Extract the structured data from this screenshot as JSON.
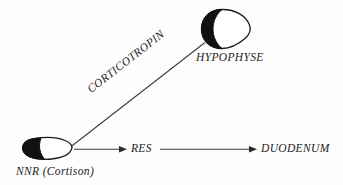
{
  "diagram": {
    "background_color": "#fdfdfd",
    "ink_color": "#1b1b1b",
    "fill_black": "#111111",
    "fill_white": "#ffffff",
    "nodes": [
      {
        "id": "hypophyse",
        "label": "HYPOPHYSE",
        "shape": "pituitary-gland-glyph",
        "style": "half-black-half-white"
      },
      {
        "id": "nnr",
        "label": "NNR (Cortison)",
        "shape": "adrenal-gland-glyph",
        "style": "half-black-half-white"
      },
      {
        "id": "res",
        "label": "RES",
        "shape": "text-node"
      },
      {
        "id": "duodenum",
        "label": "DUODENUM",
        "shape": "text-node"
      }
    ],
    "edges": [
      {
        "id": "nnr-to-hypophyse",
        "label": "CORTICOTROPIN",
        "from": "nnr",
        "to": "hypophyse",
        "arrowhead": false,
        "rotation_deg": -37.9
      },
      {
        "id": "nnr-to-res",
        "label": "",
        "from": "nnr",
        "to": "res",
        "arrowhead": true
      },
      {
        "id": "res-to-duodenum",
        "label": "",
        "from": "res",
        "to": "duodenum",
        "arrowhead": true
      }
    ]
  }
}
